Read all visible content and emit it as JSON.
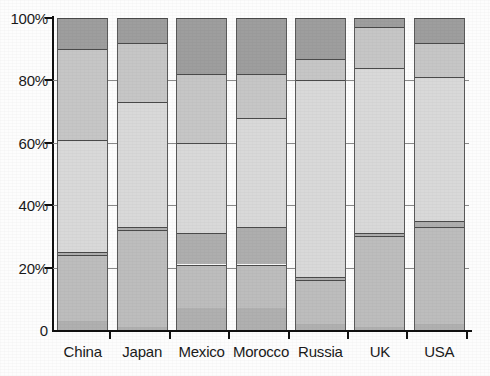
{
  "chart_data": {
    "type": "bar",
    "title": "",
    "subtitle": "",
    "xlabel": "",
    "ylabel": "",
    "stacked": true,
    "normalized_percent": true,
    "grid": true,
    "legend_position": "none",
    "ylim": [
      0,
      100
    ],
    "ytick_labels": [
      "0",
      "20%",
      "40%",
      "60%",
      "80%",
      "100%"
    ],
    "ytick_values": [
      0,
      20,
      40,
      60,
      80,
      100
    ],
    "categories": [
      "China",
      "Japan",
      "Mexico",
      "Morocco",
      "Russia",
      "UK",
      "USA"
    ],
    "series": [
      {
        "name": "Segment 1",
        "color": "#b0b0b0",
        "values": [
          3,
          1,
          7,
          7,
          2,
          1,
          2
        ]
      },
      {
        "name": "Segment 2",
        "color": "#bdbdbd",
        "values": [
          21,
          31,
          14,
          14,
          14,
          29,
          31
        ]
      },
      {
        "name": "Segment 3",
        "color": "#aeaeae",
        "values": [
          1,
          1,
          10,
          12,
          1,
          1,
          2
        ]
      },
      {
        "name": "Segment 4",
        "color": "#d9d9d9",
        "values": [
          36,
          40,
          29,
          35,
          63,
          53,
          46
        ]
      },
      {
        "name": "Segment 5",
        "color": "#c6c6c6",
        "values": [
          29,
          19,
          22,
          14,
          7,
          13,
          11
        ]
      },
      {
        "name": "Segment 6",
        "color": "#9e9e9e",
        "values": [
          10,
          8,
          18,
          18,
          13,
          3,
          8
        ]
      }
    ],
    "segment_boundaries_percent": {
      "China": [
        0,
        3,
        24,
        25,
        61,
        90,
        100
      ],
      "Japan": [
        0,
        1,
        32,
        33,
        73,
        92,
        100
      ],
      "Mexico": [
        0,
        7,
        21,
        31,
        60,
        82,
        100
      ],
      "Morocco": [
        0,
        7,
        21,
        33,
        68,
        82,
        100
      ],
      "Russia": [
        0,
        2,
        16,
        17,
        80,
        87,
        100
      ],
      "UK": [
        0,
        1,
        30,
        31,
        84,
        97,
        100
      ],
      "USA": [
        0,
        2,
        33,
        35,
        81,
        92,
        100
      ]
    }
  },
  "colors": {
    "axis": "#111111",
    "grid": "#8a8a8a",
    "segment_border": "#4a4a4a",
    "background": "#fdfdfd",
    "text": "#1a1a1a"
  }
}
